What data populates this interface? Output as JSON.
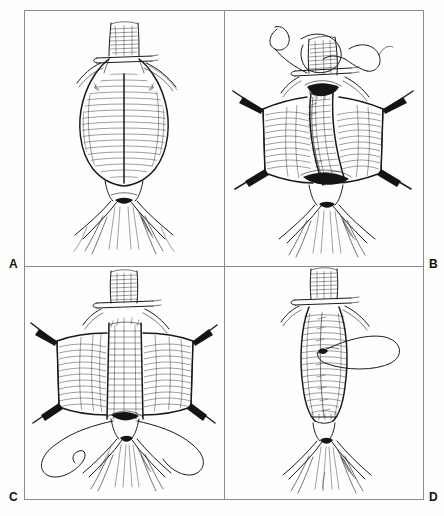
{
  "figure": {
    "style": "pen-and-ink medical line drawing",
    "panel_count": 4,
    "layout": "2x2 grid",
    "background_color": "#fefefe",
    "ink_color": "#1a1a1a",
    "border_color": "#8c8c8c"
  },
  "panels": [
    {
      "id": "a",
      "label": "A",
      "label_position": "bottom-left-outside",
      "caption": "Infrarenal abdominal aortic aneurysm exposed, with the proposed longitudinal aortotomy line marked on the anterior sac wall",
      "stage": "exposure",
      "features": [
        "proximal infrarenal aortic neck",
        "fusiform aneurysm sac with cross-hatched shading",
        "paired renal arteries crossing laterally",
        "vertical midline aortotomy incision line",
        "aortic bifurcation",
        "common iliac arteries",
        "internal and external iliac branches",
        "vascular clamp across proximal neck"
      ]
    },
    {
      "id": "b",
      "label": "B",
      "label_position": "bottom-right-outside",
      "caption": "Aneurysm sac opened longitudinally and retracted; proximal anastomosis of the prosthetic tube graft is begun with a running suture",
      "stage": "proximal anastomosis",
      "features": [
        "opened aneurysm sac retracted laterally",
        "four retractor blades holding sac walls",
        "curved suture needles with long trailing tails",
        "proximal aortic cuff",
        "prosthetic tube graft with ribbed crimped wall",
        "running anastomotic suture line",
        "distal aortic cuff at bifurcation",
        "clamp across proximal aorta"
      ]
    },
    {
      "id": "c",
      "label": "C",
      "label_position": "bottom-left-outside",
      "caption": "Completed tube graft interposition with both proximal and distal anastomoses finished; the aneurysm sac remains retracted open",
      "stage": "completed anastomoses",
      "features": [
        "completed prosthetic tube graft in situ",
        "crimped ribbed graft body",
        "proximal suture line",
        "distal suture line at bifurcation",
        "aneurysm sac walls retracted as flaps",
        "retractor blades",
        "free suture loops lying in the field",
        "patent iliac arteries"
      ]
    },
    {
      "id": "d",
      "label": "D",
      "label_position": "bottom-right-outside",
      "caption": "Aneurysm sac closed over the prosthetic graft to exclude it from the bowel, completing the repair",
      "stage": "sac closure",
      "features": [
        "aneurysm sac reapproximated over graft",
        "running closure suture line down the midline",
        "long suture loop with needle",
        "proximal clamp still applied",
        "distal anastomosis reinforced",
        "restored aortic bifurcation",
        "iliac arteries"
      ]
    }
  ],
  "labels": {
    "a": "A",
    "b": "B",
    "c": "C",
    "d": "D"
  }
}
